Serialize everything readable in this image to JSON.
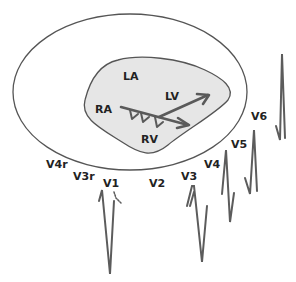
{
  "colors": {
    "outline": "#555555",
    "heart_fill": "#e6e6e6",
    "arrow": "#5a5a5a",
    "trace": "#5c5c5c",
    "label": "#222222"
  },
  "chambers": {
    "la": "LA",
    "ra": "RA",
    "lv": "LV",
    "rv": "RV"
  },
  "leads": [
    {
      "id": "v4r",
      "label": "V4r"
    },
    {
      "id": "v3r",
      "label": "V3r"
    },
    {
      "id": "v1",
      "label": "V1"
    },
    {
      "id": "v2",
      "label": "V2"
    },
    {
      "id": "v3",
      "label": "V3"
    },
    {
      "id": "v4",
      "label": "V4"
    },
    {
      "id": "v5",
      "label": "V5"
    },
    {
      "id": "v6",
      "label": "V6"
    }
  ]
}
